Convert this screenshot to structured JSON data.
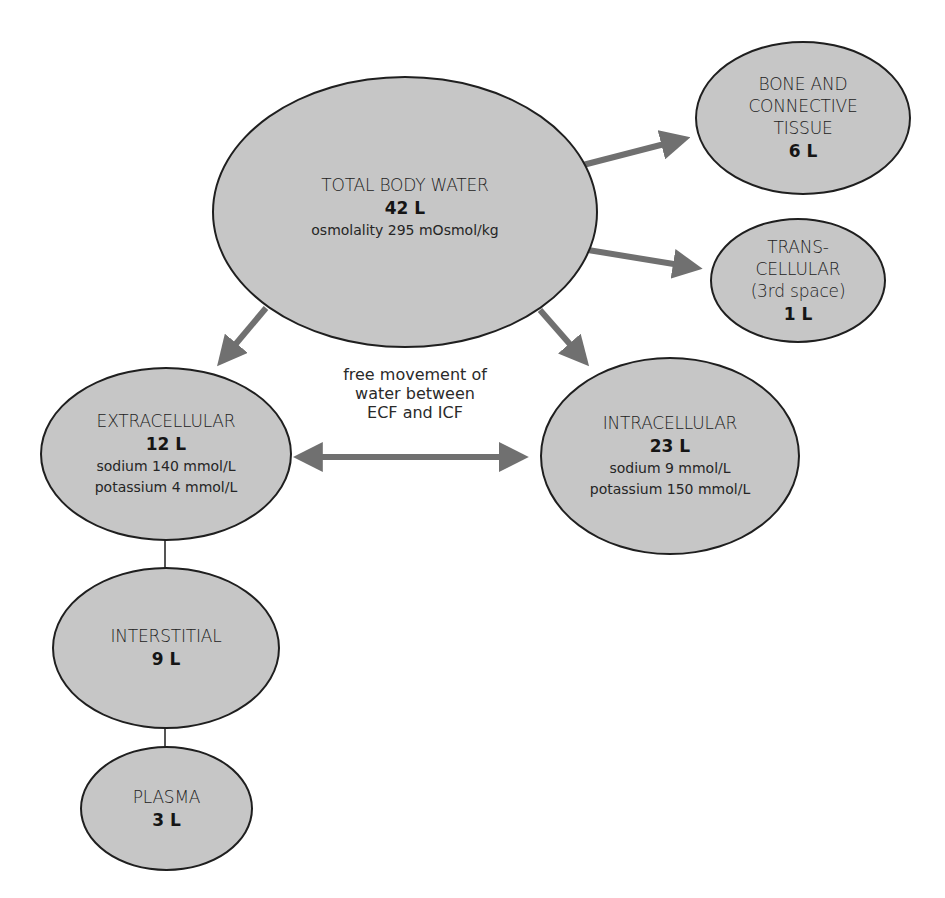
{
  "diagram": {
    "type": "body-water-compartments",
    "colors": {
      "node_fill": "#c6c6c6",
      "node_border": "#1f1f1f",
      "arrow": "#707070",
      "connector_line": "#555555",
      "text": "#1e1e1e"
    },
    "nodes": {
      "total_body_water": {
        "title": "TOTAL BODY WATER",
        "volume": "42 L",
        "detail": "osmolality 295 mOsmol/kg"
      },
      "bone_connective": {
        "title_lines": [
          "BONE AND",
          "CONNECTIVE",
          "TISSUE"
        ],
        "volume": "6 L"
      },
      "transcellular": {
        "title_lines": [
          "TRANS-",
          "CELLULAR",
          "(3rd space)"
        ],
        "volume": "1 L"
      },
      "extracellular": {
        "title": "EXTRACELLULAR",
        "volume": "12 L",
        "sodium": "sodium 140 mmol/L",
        "potassium": "potassium 4 mmol/L"
      },
      "intracellular": {
        "title": "INTRACELLULAR",
        "volume": "23 L",
        "sodium": "sodium 9 mmol/L",
        "potassium": "potassium 150 mmol/L"
      },
      "interstitial": {
        "title": "INTERSTITIAL",
        "volume": "9 L"
      },
      "plasma": {
        "title": "PLASMA",
        "volume": "3 L"
      }
    },
    "exchange_label": {
      "lines": [
        "free movement of",
        "water between",
        "ECF and ICF"
      ]
    },
    "edges": [
      {
        "from": "total_body_water",
        "to": "bone_connective",
        "style": "arrow"
      },
      {
        "from": "total_body_water",
        "to": "transcellular",
        "style": "arrow"
      },
      {
        "from": "total_body_water",
        "to": "extracellular",
        "style": "arrow"
      },
      {
        "from": "total_body_water",
        "to": "intracellular",
        "style": "arrow"
      },
      {
        "from": "extracellular",
        "to": "intracellular",
        "style": "double-arrow"
      },
      {
        "from": "extracellular",
        "to": "interstitial",
        "style": "line"
      },
      {
        "from": "interstitial",
        "to": "plasma",
        "style": "line"
      }
    ]
  }
}
